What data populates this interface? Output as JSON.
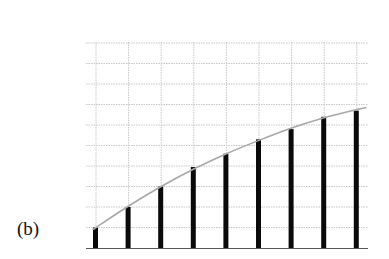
{
  "figure": {
    "label": "(b)"
  },
  "colors": {
    "bar": "#0a0a0a",
    "curve": "#a8a8a8",
    "grid": "#c8c8c8",
    "baseline": "#555555"
  },
  "chart_data": {
    "type": "bar",
    "title": "",
    "xlabel": "",
    "ylabel": "",
    "categories": [
      "1",
      "2",
      "3",
      "4",
      "5",
      "6",
      "7",
      "8",
      "9"
    ],
    "values": [
      1.0,
      2.0,
      3.0,
      3.95,
      4.6,
      5.3,
      5.8,
      6.4,
      6.7
    ],
    "overlay_curve": {
      "type": "line",
      "description": "smooth concave envelope passing through bar tops",
      "x": [
        0.95,
        1,
        2,
        3,
        4,
        5,
        6,
        7,
        8,
        9,
        9.3
      ],
      "y": [
        0.95,
        1.0,
        2.05,
        3.0,
        3.85,
        4.6,
        5.25,
        5.85,
        6.35,
        6.75,
        6.85
      ]
    },
    "ylim": [
      0,
      10
    ],
    "xlim": [
      0.75,
      9.35
    ],
    "grid": true,
    "grid_style": "dotted",
    "axis_tick_labels": false,
    "legend": null
  }
}
